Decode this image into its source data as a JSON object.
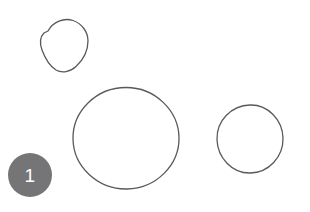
{
  "canvas": {
    "width": 310,
    "height": 212,
    "background_color": "#ffffff",
    "description": "Hand-drawn annotation sketch with three outlined closed curves and one numbered marker badge"
  },
  "style": {
    "stroke_color": "#58585e",
    "stroke_width": 1.3,
    "badge_fill_color": "#757578",
    "badge_text_color": "#ffffff"
  },
  "shapes": [
    {
      "id": "shape-top-left",
      "name": "hand-drawn-oval-small-top-left",
      "kind": "closed-freehand-oval",
      "center_x": 63,
      "center_y": 45,
      "radius_x": 25,
      "radius_y": 27,
      "bounds": {
        "x": 38,
        "y": 19,
        "width": 50,
        "height": 53
      },
      "path": "M 48.0 31.0 C 53.0 21.5 64.0 17.5 73.0 20.5 C 82.0 23.5 88.0 32.0 88.0 41.0 C 88.0 51.0 83.0 60.0 76.0 66.5 C 70.0 72.0 62.0 73.5 56.0 70.0 C 49.5 66.0 45.0 58.0 42.0 50.0 C 39.5 43.0 40.5 36.5 44.0 33.0 Z"
    },
    {
      "id": "shape-center-large",
      "name": "hand-drawn-circle-large-center",
      "kind": "closed-freehand-circle",
      "center_x": 126,
      "center_y": 138,
      "radius_x": 53,
      "radius_y": 51,
      "bounds": {
        "x": 73,
        "y": 87,
        "width": 106,
        "height": 102
      },
      "path": "M 126.0 87.5 C 155.0 87.5 178.5 110.5 179.0 137.5 C 179.5 165.0 156.0 188.5 127.0 189.0 C 97.5 189.5 73.5 166.5 73.0 139.0 C 72.5 111.0 96.5 87.5 126.0 87.5 Z"
    },
    {
      "id": "shape-right-medium",
      "name": "hand-drawn-circle-medium-right",
      "kind": "closed-freehand-circle",
      "center_x": 250,
      "center_y": 139,
      "radius_x": 33,
      "radius_y": 34,
      "bounds": {
        "x": 217,
        "y": 105,
        "width": 66,
        "height": 68
      },
      "path": "M 250.0 105.0 C 268.0 104.5 282.5 120.0 283.0 138.0 C 283.5 157.0 268.5 172.5 250.5 173.0 C 232.0 173.5 217.5 157.5 217.0 139.5 C 216.5 120.5 231.5 105.5 250.0 105.0 Z"
    }
  ],
  "markers": [
    {
      "id": "marker-1",
      "name": "annotation-marker-1",
      "label": "1",
      "center_x": 30,
      "center_y": 175,
      "diameter": 44,
      "bounds": {
        "x": 8,
        "y": 153,
        "width": 44,
        "height": 44
      },
      "font_size": 19
    }
  ]
}
